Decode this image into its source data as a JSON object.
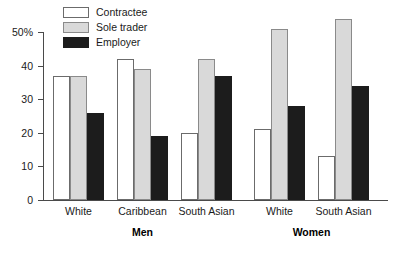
{
  "chart_data": {
    "type": "bar",
    "title": "",
    "subtitle": "",
    "xlabel": "",
    "ylabel": "",
    "ylim": [
      0,
      50
    ],
    "ytick_labels": [
      "0",
      "10",
      "20",
      "30",
      "40",
      "50%"
    ],
    "ytick_values": [
      0,
      10,
      20,
      30,
      40,
      50
    ],
    "grid": false,
    "legend_position": "top-left",
    "legend": [
      "Contractee",
      "Sole trader",
      "Employer"
    ],
    "panels": [
      {
        "label": "Men",
        "categories": [
          "White",
          "Caribbean",
          "South Asian"
        ]
      },
      {
        "label": "Women",
        "categories": [
          "White",
          "South Asian"
        ]
      }
    ],
    "categories": [
      "White",
      "Caribbean",
      "South Asian",
      "White",
      "South Asian"
    ],
    "series": [
      {
        "name": "Contractee",
        "color": "#ffffff",
        "values": [
          37,
          42,
          20,
          21,
          13
        ]
      },
      {
        "name": "Sole trader",
        "color": "#d9d9d9",
        "values": [
          37,
          39,
          42,
          51,
          54
        ]
      },
      {
        "name": "Employer",
        "color": "#1c1c1c",
        "values": [
          26,
          19,
          37,
          28,
          34
        ]
      }
    ]
  },
  "colors": {
    "contractee": "#ffffff",
    "sole_trader": "#d9d9d9",
    "employer": "#1c1c1c",
    "axis": "#4a4a4a",
    "text": "#1a1a1a",
    "background": "#ffffff"
  }
}
